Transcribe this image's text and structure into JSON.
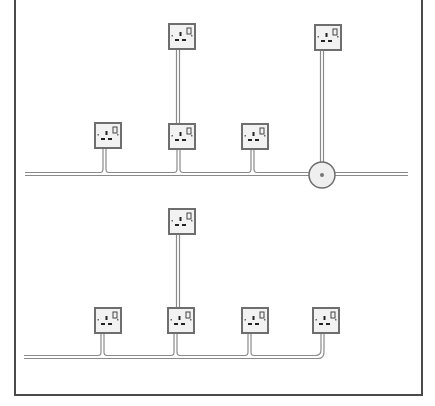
{
  "figure": {
    "panels": [
      {
        "id": "top",
        "description": "Ring circuit with spur sockets and junction box",
        "cable_y": 174,
        "cable_x_start": 25,
        "cable_x_end": 408,
        "sockets": [
          {
            "id": "spur-socket-1",
            "x": 169,
            "y": 24,
            "role": "spur"
          },
          {
            "id": "spur-socket-2",
            "x": 315,
            "y": 25,
            "role": "spur-from-junction"
          },
          {
            "id": "ring-socket-1",
            "x": 95,
            "y": 123,
            "role": "ring"
          },
          {
            "id": "ring-socket-2",
            "x": 169,
            "y": 124,
            "role": "ring-with-spur"
          },
          {
            "id": "ring-socket-3",
            "x": 242,
            "y": 124,
            "role": "ring"
          }
        ],
        "junction_box": {
          "cx": 322,
          "cy": 175,
          "r": 13
        }
      },
      {
        "id": "bottom",
        "description": "Ring circuit with spur socket and end socket",
        "cable_y": 357,
        "cable_x_start": 24,
        "sockets": [
          {
            "id": "spur-socket-3",
            "x": 169,
            "y": 209,
            "role": "spur"
          },
          {
            "id": "ring-socket-4",
            "x": 95,
            "y": 308,
            "role": "ring"
          },
          {
            "id": "ring-socket-5",
            "x": 168,
            "y": 308,
            "role": "ring-with-spur"
          },
          {
            "id": "ring-socket-6",
            "x": 242,
            "y": 308,
            "role": "ring"
          },
          {
            "id": "ring-socket-7",
            "x": 313,
            "y": 308,
            "role": "end"
          }
        ]
      }
    ],
    "colors": {
      "frame": "#4a4a4a",
      "socket_border": "#6e6e6e",
      "socket_face": "#f2f2f2",
      "cable": "#8a8a8a",
      "pin": "#222222"
    }
  }
}
